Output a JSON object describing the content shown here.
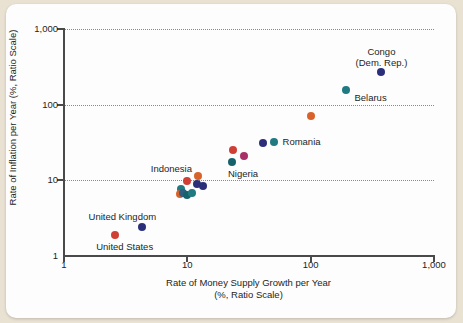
{
  "chart_data": {
    "type": "scatter",
    "title": "",
    "xlabel": "Rate of Money Supply Growth per Year",
    "xlabel_sub": "(%, Ratio Scale)",
    "ylabel": "Rate of Inflation per Year (%, Ratio Scale)",
    "xscale": "log",
    "yscale": "log",
    "xlim": [
      1,
      1000
    ],
    "ylim": [
      1,
      1000
    ],
    "xticks": [
      "1",
      "10",
      "100",
      "1,000"
    ],
    "xtick_values": [
      1,
      10,
      100,
      1000
    ],
    "yticks": [
      "1",
      "10",
      "100",
      "1,000"
    ],
    "ytick_values": [
      1,
      10,
      100,
      1000
    ],
    "grid": "horizontal-dotted",
    "legend": "none",
    "colors": {
      "red": "#cf3f36",
      "orange": "#d9622b",
      "navy": "#2b2f7a",
      "teal": "#1f7a82",
      "darkteal": "#17616b",
      "magenta": "#a8306a",
      "steel": "#2f5d82",
      "axis": "#4a4a4a",
      "background": "#fdfdfd",
      "page": "#e9e1d2"
    },
    "points": [
      {
        "name": "United States",
        "x": 2.6,
        "y": 1.9,
        "color": "#cf3f36"
      },
      {
        "name": "United Kingdom",
        "x": 4.3,
        "y": 2.4,
        "color": "#2b2f7a"
      },
      {
        "name": "",
        "x": 8.9,
        "y": 7.6,
        "color": "#1f7a82"
      },
      {
        "name": "",
        "x": 8.8,
        "y": 6.5,
        "color": "#d9622b"
      },
      {
        "name": "",
        "x": 9.2,
        "y": 6.9,
        "color": "#2f5d82"
      },
      {
        "name": "Indonesia",
        "x": 9.9,
        "y": 9.8,
        "color": "#cf3f36"
      },
      {
        "name": "",
        "x": 10.0,
        "y": 6.4,
        "color": "#17616b"
      },
      {
        "name": "",
        "x": 11.0,
        "y": 6.7,
        "color": "#1f7a82"
      },
      {
        "name": "",
        "x": 12.3,
        "y": 11.3,
        "color": "#d9622b"
      },
      {
        "name": "",
        "x": 11.9,
        "y": 8.9,
        "color": "#2b2f7a"
      },
      {
        "name": "",
        "x": 13.5,
        "y": 8.4,
        "color": "#2b2f7a"
      },
      {
        "name": "",
        "x": 23.5,
        "y": 25.0,
        "color": "#cf3f36"
      },
      {
        "name": "Nigeria",
        "x": 23.0,
        "y": 17.5,
        "color": "#17616b"
      },
      {
        "name": "",
        "x": 29.0,
        "y": 21.0,
        "color": "#a8306a"
      },
      {
        "name": "",
        "x": 41.0,
        "y": 31.0,
        "color": "#2b2f7a"
      },
      {
        "name": "Romania",
        "x": 50.0,
        "y": 32.0,
        "color": "#1f7a82"
      },
      {
        "name": "",
        "x": 100.0,
        "y": 70.0,
        "color": "#d9622b"
      },
      {
        "name": "Belarus",
        "x": 195.0,
        "y": 155.0,
        "color": "#1f7a82"
      },
      {
        "name": "Congo (Dem. Rep.)",
        "x": 375.0,
        "y": 270.0,
        "color": "#2b2f7a"
      }
    ],
    "annotations": [
      {
        "text": "Congo",
        "for": "Congo (Dem. Rep.)"
      },
      {
        "text": "(Dem. Rep.)",
        "for": "Congo (Dem. Rep.)"
      },
      {
        "text": "Belarus",
        "for": "Belarus"
      },
      {
        "text": "Romania",
        "for": "Romania"
      },
      {
        "text": "Nigeria",
        "for": "Nigeria"
      },
      {
        "text": "Indonesia",
        "for": "Indonesia"
      },
      {
        "text": "United Kingdom",
        "for": "United Kingdom"
      },
      {
        "text": "United States",
        "for": "United States"
      }
    ]
  },
  "axes": {
    "y_title": "Rate of Inflation per Year (%, Ratio Scale)",
    "x_title_line1": "Rate of Money Supply Growth per Year",
    "x_title_line2": "(%, Ratio Scale)",
    "y_tick_1000": "1,000",
    "y_tick_100": "100",
    "y_tick_10": "10",
    "y_tick_1": "1",
    "x_tick_1": "1",
    "x_tick_10": "10",
    "x_tick_100": "100",
    "x_tick_1000": "1,000"
  },
  "labels": {
    "congo_line1": "Congo",
    "congo_line2": "(Dem. Rep.)",
    "belarus": "Belarus",
    "romania": "Romania",
    "nigeria": "Nigeria",
    "indonesia": "Indonesia",
    "united_kingdom": "United Kingdom",
    "united_states": "United States"
  }
}
